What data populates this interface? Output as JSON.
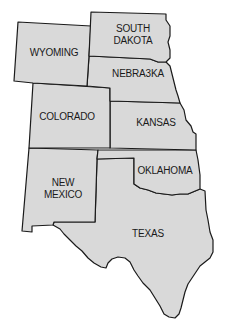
{
  "map": {
    "title": "",
    "fill_color": "#d9d9d9",
    "stroke_color": "#1a1a1a",
    "states": [
      {
        "id": "wyoming",
        "label": "WYOMING"
      },
      {
        "id": "south-dakota",
        "label_line1": "SOUTH",
        "label_line2": "DAKOTA"
      },
      {
        "id": "nebraska",
        "label": "NEBRA3KA"
      },
      {
        "id": "colorado",
        "label": "COLORADO"
      },
      {
        "id": "kansas",
        "label": "KANSAS"
      },
      {
        "id": "new-mexico",
        "label_line1": "NEW",
        "label_line2": "MEXICO"
      },
      {
        "id": "oklahoma",
        "label": "OKLAHOMA"
      },
      {
        "id": "texas",
        "label": "TEXAS"
      }
    ]
  }
}
